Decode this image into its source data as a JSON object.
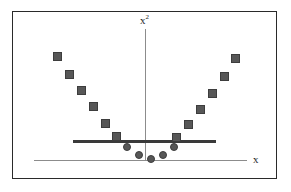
{
  "figure": {
    "background_color": "#ffffff",
    "frame_color": "#2a2a2a"
  },
  "axes": {
    "y_label_base": "x",
    "y_label_exponent": "2",
    "x_label": "x",
    "axis_color": "#8c8c8c"
  },
  "threshold": {
    "label": "threshold-line",
    "color": "#3a3a3a"
  },
  "markers": {
    "square_color": "#575757",
    "square_edge_color": "#3d3d3d",
    "circle_color": "#575757",
    "circle_edge_color": "#3d3d3d"
  },
  "chart_data": {
    "type": "scatter",
    "title": "",
    "subtitle": "",
    "xlabel": "x",
    "ylabel": "x²",
    "grid": false,
    "legend": null,
    "xlim": [
      -6,
      6
    ],
    "ylim": [
      0,
      36
    ],
    "annotations": [
      {
        "name": "threshold-line",
        "type": "hline",
        "y": 4,
        "x_start": -4.6,
        "x_end": 3.4,
        "color": "#3a3a3a",
        "linewidth": 2.6
      }
    ],
    "series": [
      {
        "name": "positive-class-squares",
        "marker": "square",
        "color": "#575757",
        "comment": "points with large |x| mapped above the threshold",
        "points": [
          {
            "x": -5.2,
            "y": 27.0,
            "px": 44,
            "py": 44
          },
          {
            "x": -4.5,
            "y": 20.2,
            "px": 56,
            "py": 62
          },
          {
            "x": -3.8,
            "y": 14.4,
            "px": 68,
            "py": 78
          },
          {
            "x": -3.2,
            "y": 10.2,
            "px": 80,
            "py": 94
          },
          {
            "x": -2.5,
            "y": 6.2,
            "px": 92,
            "py": 111
          },
          {
            "x": -1.9,
            "y": 3.6,
            "px": 103,
            "py": 124
          },
          {
            "x": 1.7,
            "y": 3.4,
            "px": 163,
            "py": 125
          },
          {
            "x": 2.3,
            "y": 5.8,
            "px": 175,
            "py": 112
          },
          {
            "x": 3.0,
            "y": 9.4,
            "px": 187,
            "py": 97
          },
          {
            "x": 3.7,
            "y": 13.8,
            "px": 199,
            "py": 81
          },
          {
            "x": 4.4,
            "y": 19.4,
            "px": 211,
            "py": 64
          },
          {
            "x": 5.1,
            "y": 26.0,
            "px": 222,
            "py": 46
          }
        ]
      },
      {
        "name": "negative-class-circles",
        "marker": "circle",
        "color": "#575757",
        "comment": "points near origin mapped below the threshold",
        "points": [
          {
            "x": -1.3,
            "y": 1.7,
            "px": 114,
            "py": 135
          },
          {
            "x": -0.9,
            "y": 0.8,
            "px": 126,
            "py": 143
          },
          {
            "x": 0.0,
            "y": 0.0,
            "px": 138,
            "py": 147
          },
          {
            "x": 0.9,
            "y": 0.8,
            "px": 150,
            "py": 143
          },
          {
            "x": 1.3,
            "y": 1.7,
            "px": 161,
            "py": 135
          }
        ]
      }
    ]
  }
}
